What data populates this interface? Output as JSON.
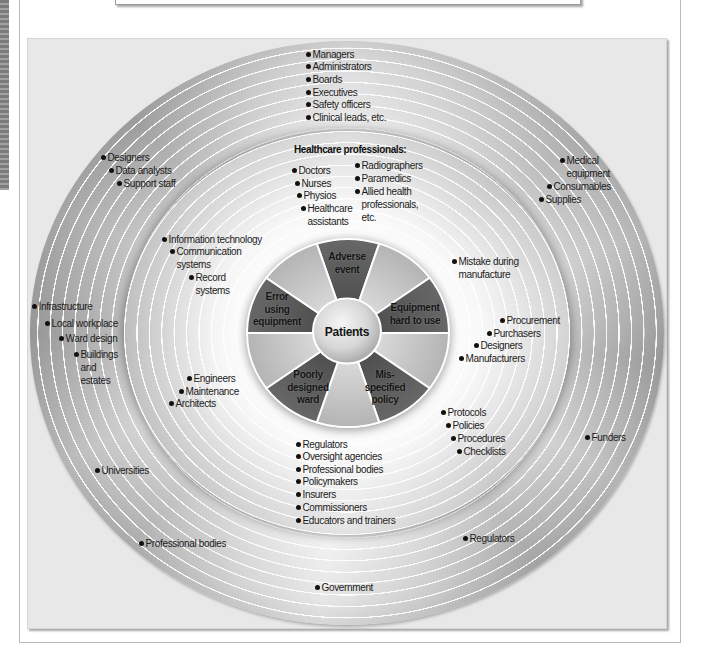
{
  "figure": {
    "center": "Patients",
    "wheel": [
      "Adverse\nevent",
      "Equipment\nhard to use",
      "Mis-\nspecified\npolicy",
      "Poorly\ndesigned\nward",
      "Error\nusing\nequipment"
    ],
    "inner_ring": {
      "healthcare_heading": "Healthcare professionals:",
      "healthcare_col1": [
        "Doctors",
        "Nurses",
        "Physios",
        "Healthcare\nassistants"
      ],
      "healthcare_col2": [
        "Radiographers",
        "Paramedics",
        "Allied health\nprofessionals,\netc."
      ],
      "information_technology": [
        "Information technology",
        "Communication\nsystems",
        "Record\nsystems"
      ],
      "estates": [
        "Engineers",
        "Maintenance",
        "Architects"
      ],
      "manufacture": [
        "Mistake during\nmanufacture"
      ],
      "procurement": [
        "Procurement",
        "Purchasers",
        "Designers",
        "Manufacturers"
      ],
      "policy": [
        "Protocols",
        "Policies",
        "Procedures",
        "Checklists"
      ],
      "regulation": [
        "Regulators",
        "Oversight agencies",
        "Professional bodies",
        "Policymakers",
        "Insurers",
        "Commissioners",
        "Educators and trainers"
      ]
    },
    "outer_ring": {
      "management": [
        "Managers",
        "Administrators",
        "Boards",
        "Executives",
        "Safety officers",
        "Clinical leads, etc."
      ],
      "support": [
        "Designers",
        "Data analysts",
        "Support staff"
      ],
      "supply": [
        "Medical\nequipment",
        "Consumables",
        "Supplies"
      ],
      "infrastructure": [
        "Infrastructure",
        "Local workplace",
        "Ward design",
        "Buildings\nand\nestates"
      ],
      "funders": [
        "Funders"
      ],
      "education": [
        "Universities",
        "Professional bodies"
      ],
      "regulators": [
        "Regulators"
      ],
      "government": [
        "Government"
      ]
    }
  },
  "colors": {
    "dark_segment": "#5d5d5d",
    "light_segment": "#c4c4c4",
    "panel": "#e8e8e8",
    "text": "#1c1c1c"
  }
}
